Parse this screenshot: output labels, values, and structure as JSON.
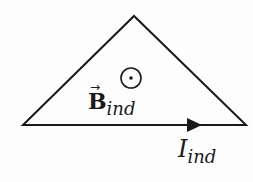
{
  "diagram": {
    "colors": {
      "stroke": "#1a1a1a",
      "background": "#fdfdfd"
    },
    "triangle": {
      "vertices": [
        [
          23,
          125
        ],
        [
          134,
          16
        ],
        [
          246,
          125
        ]
      ]
    },
    "current_arrow": {
      "direction": "right",
      "tip": [
        202,
        125
      ]
    },
    "field_symbol": {
      "icon": "out-of-page-dot-circle",
      "meaning": "field pointing out of page",
      "center": [
        131,
        78
      ],
      "radius": 10
    },
    "labels": {
      "field": {
        "vector_arrow": "→",
        "main": "B",
        "subscript": "ind"
      },
      "current": {
        "main": "I",
        "subscript": "ind"
      }
    }
  }
}
